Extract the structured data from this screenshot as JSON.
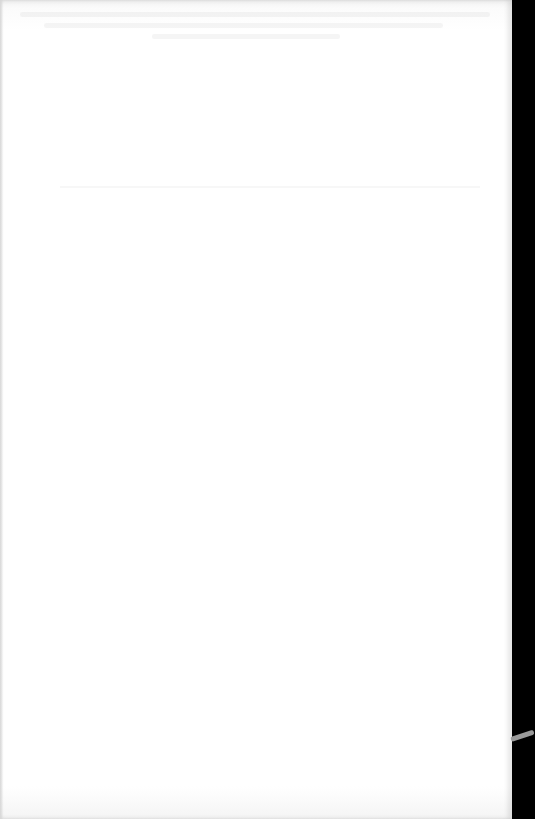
{
  "document": {
    "type": "scanned-page",
    "page_content": "",
    "background_color": "#ffffff",
    "edge_color": "#000000"
  }
}
